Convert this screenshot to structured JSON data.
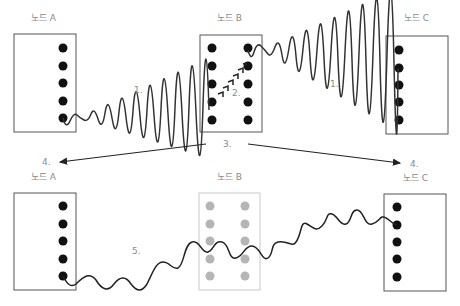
{
  "top_row": {
    "node_a": {
      "label": "노드 A",
      "box": {
        "x": 14,
        "y": 34,
        "w": 62,
        "h": 98
      },
      "dots_x": [
        63
      ],
      "dots_y": [
        48,
        66,
        83,
        101,
        118
      ],
      "dot_color": "#111111",
      "border_color": "#555555"
    },
    "node_b": {
      "label": "노드 B",
      "box": {
        "x": 200,
        "y": 35,
        "w": 62,
        "h": 97
      },
      "dots_x": [
        212,
        248
      ],
      "dots_y": [
        48,
        66,
        84,
        102,
        120
      ],
      "dot_color": "#111111",
      "border_color": "#555555"
    },
    "node_c": {
      "label": "노드 C",
      "box": {
        "x": 386,
        "y": 36,
        "w": 62,
        "h": 98
      },
      "dots_x": [
        399
      ],
      "dots_y": [
        50,
        68,
        85,
        102,
        120
      ],
      "dot_color": "#111111",
      "border_color": "#555555"
    }
  },
  "bottom_row": {
    "node_a": {
      "label": "노드 A",
      "box": {
        "x": 14,
        "y": 193,
        "w": 62,
        "h": 97
      },
      "dots_x": [
        63
      ],
      "dots_y": [
        206,
        224,
        241,
        259,
        276
      ],
      "dot_color": "#111111",
      "border_color": "#555555"
    },
    "node_b": {
      "label": "노드 B",
      "box": {
        "x": 199,
        "y": 193,
        "w": 61,
        "h": 97
      },
      "dots_x": [
        210,
        245
      ],
      "dots_y": [
        206,
        224,
        241,
        259,
        276
      ],
      "dot_color": "#b5b5b5",
      "border_color": "#c8c8c8"
    },
    "node_c": {
      "label": "노드 C",
      "box": {
        "x": 384,
        "y": 194,
        "w": 62,
        "h": 97
      },
      "dots_x": [
        397
      ],
      "dots_y": [
        207,
        225,
        242,
        259,
        277
      ],
      "dot_color": "#111111",
      "border_color": "#555555"
    }
  },
  "steps": {
    "step1_left": "1.",
    "step1_right": "1.",
    "step2": "2.",
    "step3": "3.",
    "step4_left": "4.",
    "step4_right": "4.",
    "step5": "5."
  },
  "colors": {
    "line": "#222222",
    "label_text": "#8a8a8a"
  }
}
